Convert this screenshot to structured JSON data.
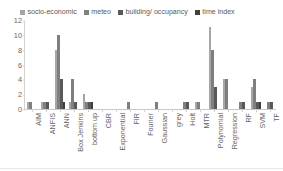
{
  "legend": {
    "position": "top",
    "entries": [
      {
        "label": "socio-economic",
        "color": "#a6a6a6",
        "icon": "legend-swatch-icon"
      },
      {
        "label": "meteo",
        "color": "#7f7f7f",
        "icon": "legend-swatch-icon"
      },
      {
        "label": "building/ occupancy",
        "color": "#595959",
        "icon": "legend-swatch-icon"
      },
      {
        "label": "time index",
        "color": "#404040",
        "icon": "legend-swatch-icon"
      }
    ]
  },
  "chart_data": {
    "type": "bar",
    "title": "",
    "xlabel": "",
    "ylabel": "",
    "ylim": [
      0,
      12
    ],
    "yticks": [
      0,
      2,
      4,
      6,
      8,
      10,
      12
    ],
    "grid": false,
    "legend_position": "top",
    "categories": [
      "AIM",
      "ANFIS",
      "ANN",
      "Box Jenkins",
      "bottom up",
      "CBR",
      "Exponential",
      "FIR",
      "Fourier",
      "Gaussian",
      "grey",
      "Holt",
      "MTR",
      "Polynomial",
      "Regression",
      "RF",
      "SVM",
      "TF"
    ],
    "series": [
      {
        "name": "socio-economic",
        "color": "#a6a6a6",
        "values": [
          1,
          1,
          8,
          1,
          2,
          0,
          0,
          0,
          0,
          0,
          0,
          0,
          1,
          11,
          4,
          0,
          3,
          0
        ]
      },
      {
        "name": "meteo",
        "color": "#7f7f7f",
        "values": [
          1,
          1,
          10,
          4,
          1,
          0,
          0,
          1,
          0,
          1,
          0,
          1,
          1,
          8,
          4,
          1,
          4,
          1
        ]
      },
      {
        "name": "building/ occupancy",
        "color": "#595959",
        "values": [
          0,
          1,
          4,
          1,
          1,
          0,
          0,
          0,
          0,
          0,
          0,
          1,
          0,
          3,
          0,
          1,
          1,
          1
        ]
      },
      {
        "name": "time index",
        "color": "#404040",
        "values": [
          0,
          0,
          1,
          0,
          1,
          0,
          0,
          0,
          0,
          0,
          0,
          0,
          0,
          0,
          0,
          0,
          1,
          0
        ]
      }
    ]
  }
}
